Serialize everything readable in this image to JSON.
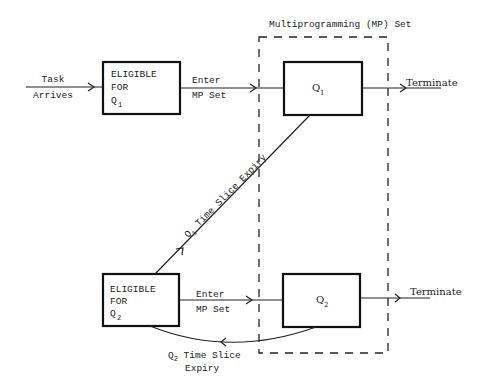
{
  "diagram": {
    "mp_set": {
      "title": "Multiprogramming (MP) Set"
    },
    "nodes": {
      "eligible_q1": {
        "line1": "ELIGIBLE",
        "line2": "FOR",
        "q": "Q",
        "sub": "1"
      },
      "eligible_q2": {
        "line1": "ELIGIBLE",
        "line2": "FOR",
        "q": "Q",
        "sub": "2"
      },
      "q1": {
        "q": "Q",
        "sub": "1"
      },
      "q2": {
        "q": "Q",
        "sub": "2"
      }
    },
    "edges": {
      "task_arrives": {
        "line1": "Task",
        "line2": "Arrives"
      },
      "enter_mp_1": {
        "line1": "Enter",
        "line2": "MP Set"
      },
      "enter_mp_2": {
        "line1": "Enter",
        "line2": "MP Set"
      },
      "terminate_1": {
        "label": "Terminate"
      },
      "terminate_2": {
        "label": "Terminate"
      },
      "q1_expiry": {
        "q": "Q",
        "sub": "1",
        "rest": " Time Slice Expiry"
      },
      "q2_expiry": {
        "q": "Q",
        "sub": "2",
        "rest": " Time Slice",
        "line2": "Expiry"
      }
    }
  },
  "colors": {
    "ink": "#222222",
    "background": "#ffffff"
  }
}
